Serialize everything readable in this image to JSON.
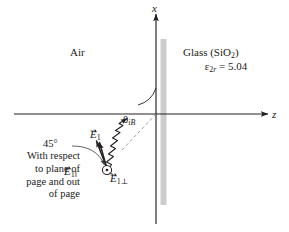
{
  "figure": {
    "background_color": "#ffffff",
    "line_color": "#231f20",
    "interface_color": "#c9c9c9"
  },
  "axes": {
    "x_label": "x",
    "z_label": "z",
    "origin_x": 156,
    "origin_y": 114
  },
  "media": {
    "left": {
      "name": "Air"
    },
    "right": {
      "name": "Glass (SiO",
      "name_sub": "2",
      "name_tail": ")",
      "permittivity_symbol": "ε",
      "permittivity_sub": "2",
      "permittivity_sub_italic": "r",
      "permittivity_equals": "= 5.04",
      "permittivity_value": 5.04,
      "permittivity_text": "ε2r = 5.04"
    }
  },
  "angle": {
    "symbol": "θ",
    "subscript": "iB",
    "full": "θiB",
    "meaning": "Brewster angle of incidence"
  },
  "fields": {
    "total": {
      "symbol": "E",
      "subscript": "1",
      "full": "E1"
    },
    "parallel": {
      "symbol": "E",
      "subscript": "1‖",
      "full": "E1‖"
    },
    "perpendicular": {
      "symbol": "E",
      "subscript": "1⊥",
      "full": "E1⊥"
    }
  },
  "callout": {
    "angle_value": "45°",
    "lines": [
      "With respect",
      "to plane of",
      "page and out",
      "of page"
    ],
    "text": "45° With respect to plane of page and out of page"
  },
  "icons": {
    "out_of_page": "circled-dot-icon",
    "wave_ray": "wavy-ray-icon",
    "arrowhead": "arrowhead-icon"
  }
}
